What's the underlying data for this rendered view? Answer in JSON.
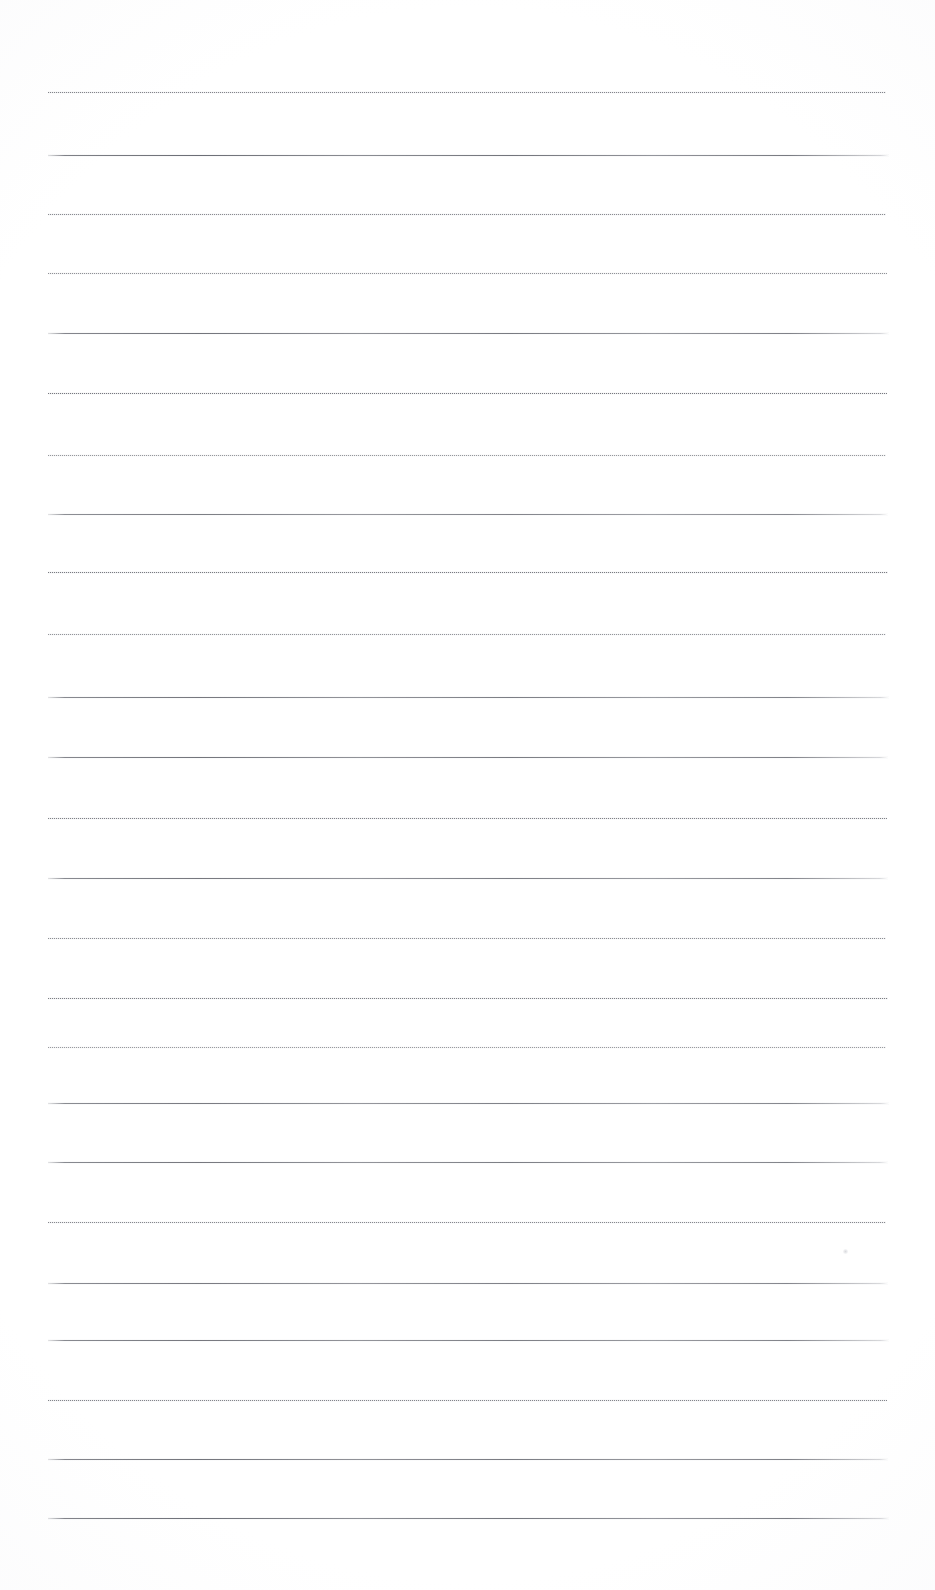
{
  "document": {
    "type": "scanned-ruled-writing-paper",
    "title": "",
    "page_width": 935,
    "page_height": 1590,
    "background_color": "#ffffff",
    "ink_color": "#5c5e66",
    "text_content": "",
    "is_blank": true
  },
  "ruling": {
    "line_count": 25,
    "first_line_y": 92,
    "line_spacing": 59.4,
    "line_left_x": 48,
    "line_right_x": 888,
    "line_thickness": 1,
    "margin_left": 48,
    "margin_right": 47,
    "lines": [
      {
        "y": 92,
        "style": "dotted",
        "left": 48,
        "right": 886,
        "opacity": 0.78
      },
      {
        "y": 155,
        "style": "solid",
        "left": 48,
        "right": 889,
        "opacity": 0.92
      },
      {
        "y": 214,
        "style": "dotted",
        "left": 48,
        "right": 886,
        "opacity": 0.74
      },
      {
        "y": 273,
        "style": "dotted",
        "left": 48,
        "right": 887,
        "opacity": 0.7
      },
      {
        "y": 333,
        "style": "solid",
        "left": 48,
        "right": 889,
        "opacity": 0.88
      },
      {
        "y": 393,
        "style": "dotted",
        "left": 48,
        "right": 887,
        "opacity": 0.86
      },
      {
        "y": 455,
        "style": "dotted",
        "left": 48,
        "right": 886,
        "opacity": 0.66
      },
      {
        "y": 514,
        "style": "solid",
        "left": 48,
        "right": 888,
        "opacity": 0.82
      },
      {
        "y": 572,
        "style": "dotted",
        "left": 48,
        "right": 888,
        "opacity": 0.84
      },
      {
        "y": 634,
        "style": "dotted",
        "left": 48,
        "right": 886,
        "opacity": 0.68
      },
      {
        "y": 697,
        "style": "solid",
        "left": 48,
        "right": 889,
        "opacity": 0.86
      },
      {
        "y": 757,
        "style": "solid",
        "left": 48,
        "right": 888,
        "opacity": 0.88
      },
      {
        "y": 818,
        "style": "dotted",
        "left": 48,
        "right": 887,
        "opacity": 0.8
      },
      {
        "y": 878,
        "style": "solid",
        "left": 48,
        "right": 888,
        "opacity": 0.86
      },
      {
        "y": 938,
        "style": "dotted",
        "left": 48,
        "right": 886,
        "opacity": 0.72
      },
      {
        "y": 998,
        "style": "dotted",
        "left": 48,
        "right": 888,
        "opacity": 0.82
      },
      {
        "y": 1047,
        "style": "dotted",
        "left": 48,
        "right": 886,
        "opacity": 0.64
      },
      {
        "y": 1103,
        "style": "solid",
        "left": 48,
        "right": 889,
        "opacity": 0.84
      },
      {
        "y": 1162,
        "style": "solid",
        "left": 48,
        "right": 888,
        "opacity": 0.86
      },
      {
        "y": 1222,
        "style": "dotted",
        "left": 48,
        "right": 886,
        "opacity": 0.76
      },
      {
        "y": 1283,
        "style": "solid",
        "left": 48,
        "right": 888,
        "opacity": 0.84
      },
      {
        "y": 1340,
        "style": "solid",
        "left": 48,
        "right": 889,
        "opacity": 0.86
      },
      {
        "y": 1400,
        "style": "dotted",
        "left": 48,
        "right": 887,
        "opacity": 0.78
      },
      {
        "y": 1459,
        "style": "solid",
        "left": 48,
        "right": 888,
        "opacity": 0.88
      },
      {
        "y": 1518,
        "style": "solid",
        "left": 48,
        "right": 889,
        "opacity": 0.9
      }
    ]
  },
  "artifacts": {
    "speck": {
      "x": 845,
      "y": 1251,
      "size": 5
    }
  }
}
